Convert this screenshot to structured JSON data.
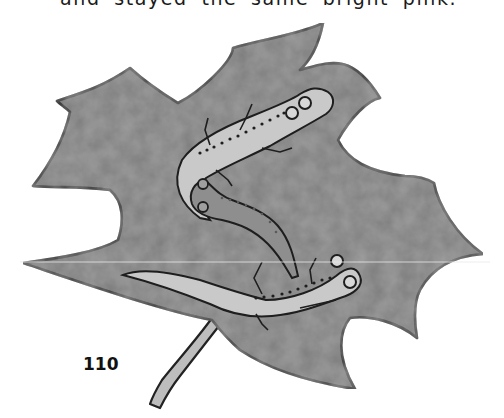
{
  "page": {
    "body_text_fragment": "and stayed the same bright pink.",
    "page_number": "110"
  },
  "illustration": {
    "subject": "maple leaf with three salamanders",
    "colors": {
      "leaf_fill": "#7d7d7d",
      "leaf_outline": "#2a2a2a",
      "salamander_light": "#c9c9c9",
      "salamander_dark": "#8e8e8e",
      "spots": "#1e1e1e"
    }
  }
}
